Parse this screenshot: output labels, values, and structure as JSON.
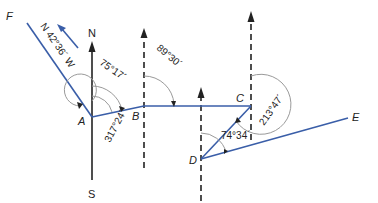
{
  "diagram": {
    "type": "traverse-bearing-diagram",
    "colors": {
      "traverse_line": "#3a5ea8",
      "meridian_line": "#222222",
      "arc": "#9a9a9a"
    },
    "compass": {
      "north_label": "N",
      "south_label": "S"
    },
    "points": {
      "F": "F",
      "A": "A",
      "B": "B",
      "C": "C",
      "D": "D",
      "E": "E"
    },
    "bearings": {
      "AF": "N 42°36´ W",
      "AB": "75°17´",
      "A_reflex": "317°24´",
      "BC": "89°30´",
      "C_angle": "213°47´",
      "D_angle": "74°34´"
    }
  }
}
